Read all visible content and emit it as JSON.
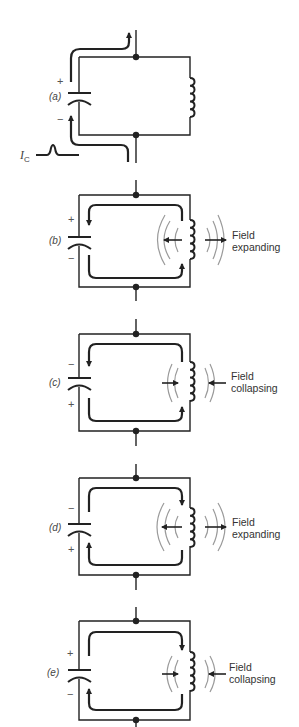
{
  "figure": {
    "colors": {
      "wire": "#222222",
      "field": "#9a9a9a",
      "text": "#444444"
    },
    "current_pulse_label": "I",
    "current_pulse_subscript": "C",
    "panels": [
      {
        "id": "a",
        "label": "(a)",
        "top_sign": "+",
        "bottom_sign": "−",
        "field_label": null
      },
      {
        "id": "b",
        "label": "(b)",
        "top_sign": "+",
        "bottom_sign": "−",
        "field_label_1": "Field",
        "field_label_2": "expanding"
      },
      {
        "id": "c",
        "label": "(c)",
        "top_sign": "−",
        "bottom_sign": "+",
        "field_label_1": "Field",
        "field_label_2": "collapsing"
      },
      {
        "id": "d",
        "label": "(d)",
        "top_sign": "−",
        "bottom_sign": "+",
        "field_label_1": "Field",
        "field_label_2": "expanding"
      },
      {
        "id": "e",
        "label": "(e)",
        "top_sign": "+",
        "bottom_sign": "−",
        "field_label_1": "Field",
        "field_label_2": "collapsing"
      }
    ]
  }
}
